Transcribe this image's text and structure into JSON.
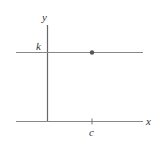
{
  "diagram": {
    "type": "coordinate-plane",
    "axes": {
      "x_label": "x",
      "y_label": "y"
    },
    "horizontal_line": {
      "label": "k",
      "description": "horizontal line y = k"
    },
    "point": {
      "description": "point (c, k) on line y = k"
    },
    "tick": {
      "label": "c"
    },
    "colors": {
      "line": "#888888",
      "axis": "#666666",
      "point": "#555555",
      "text": "#333333"
    }
  }
}
